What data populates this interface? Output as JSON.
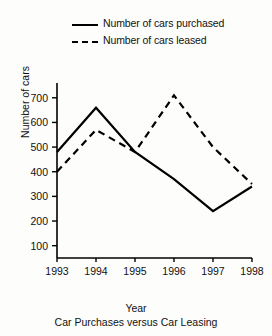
{
  "legend": {
    "position": "top",
    "items": [
      {
        "label": "Number of cars purchased",
        "style": "solid",
        "swatch_icon": "solid-line-icon"
      },
      {
        "label": "Number of cars leased",
        "style": "dashed",
        "swatch_icon": "dashed-line-icon"
      }
    ]
  },
  "axes": {
    "ylabel": "Number of cars",
    "xlabel": "Year",
    "yticks": [
      "700",
      "600",
      "500",
      "400",
      "300",
      "200",
      "100"
    ],
    "xticks": [
      "1993",
      "1994",
      "1995",
      "1996",
      "1997",
      "1998"
    ]
  },
  "caption": "Car Purchases versus Car Leasing",
  "colors": {
    "line": "#000000",
    "axis": "#000000",
    "background": "#fdfdfb"
  },
  "chart_data": {
    "type": "line",
    "title": "Car Purchases versus Car Leasing",
    "xlabel": "Year",
    "ylabel": "Number of cars",
    "categories": [
      "1993",
      "1994",
      "1995",
      "1996",
      "1997",
      "1998"
    ],
    "x": [
      1993,
      1994,
      1995,
      1996,
      1997,
      1998
    ],
    "series": [
      {
        "name": "Number of cars purchased",
        "style": "solid",
        "values": [
          480,
          660,
          480,
          370,
          240,
          340
        ]
      },
      {
        "name": "Number of cars leased",
        "style": "dashed",
        "values": [
          400,
          570,
          480,
          710,
          500,
          350
        ]
      }
    ],
    "ylim": [
      50,
      760
    ],
    "ytick_values": [
      700,
      600,
      500,
      400,
      300,
      200,
      100
    ],
    "grid": false,
    "legend_position": "top"
  }
}
